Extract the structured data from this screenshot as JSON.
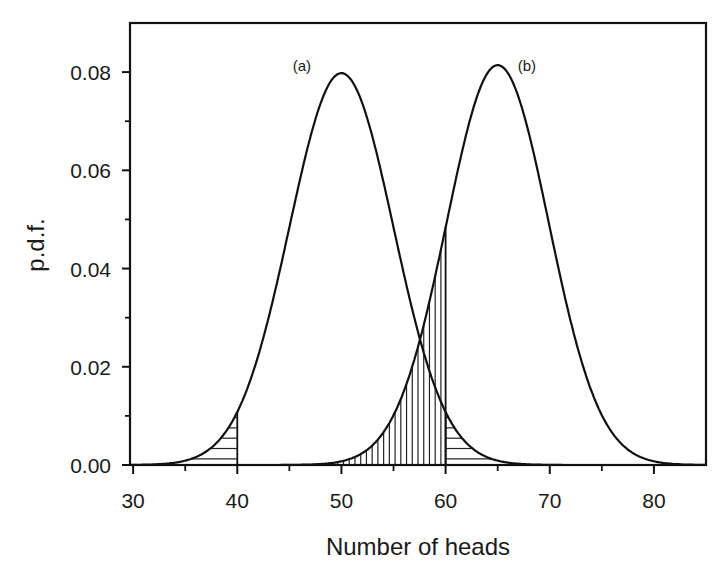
{
  "chart_data": {
    "type": "line",
    "title": "",
    "xlabel": "Number of heads",
    "ylabel": "p.d.f.",
    "xlim": [
      29.7,
      85
    ],
    "ylim": [
      0,
      0.09
    ],
    "x_ticks": [
      30,
      40,
      50,
      60,
      70,
      80
    ],
    "x_tick_labels": [
      "30",
      "40",
      "50",
      "60",
      "70",
      "80"
    ],
    "x_minor_ticks": [
      35,
      45,
      55,
      65,
      75
    ],
    "y_ticks": [
      0.0,
      0.02,
      0.04,
      0.06,
      0.08
    ],
    "y_tick_labels": [
      "0.00",
      "0.02",
      "0.04",
      "0.06",
      "0.08"
    ],
    "y_minor_ticks": [
      0.01,
      0.03,
      0.05,
      0.07
    ],
    "grid": false,
    "legend": "none",
    "series": [
      {
        "name": "(a)",
        "distribution": "normal",
        "mean": 50,
        "sd": 5.0,
        "peak": 0.0798,
        "label_position": {
          "x": 46.2,
          "y": 0.0803
        }
      },
      {
        "name": "(b)",
        "distribution": "normal",
        "mean": 65,
        "sd": 4.9,
        "peak": 0.0814,
        "label_position": {
          "x": 67.8,
          "y": 0.0803
        }
      }
    ],
    "shaded_regions": [
      {
        "series": "(a)",
        "from": 33,
        "to": 40,
        "hatch": "horizontal",
        "description": "left tail of (a) up to 40"
      },
      {
        "series": "(b)",
        "from": 48,
        "to": 60,
        "hatch": "vertical",
        "description": "left tail of (b) up to 60"
      },
      {
        "series": "(a)",
        "from": 60,
        "to": 67,
        "hatch": "horizontal",
        "description": "right tail of (a) beyond 60"
      }
    ],
    "annotations": [
      {
        "text": "(a)",
        "near": "peak of curve a"
      },
      {
        "text": "(b)",
        "near": "peak of curve b"
      },
      {
        "text": "curves intersect",
        "x": 57.3,
        "y": 0.025
      }
    ]
  },
  "plot_area": {
    "left": 130,
    "top": 23,
    "right": 706,
    "bottom": 465
  }
}
